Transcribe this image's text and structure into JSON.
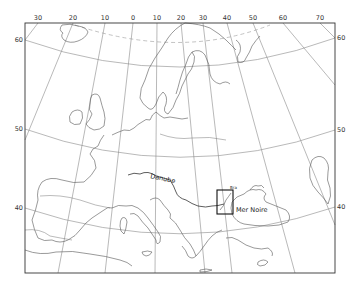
{
  "map": {
    "title": "",
    "frame": {
      "x": 25,
      "y": 23,
      "width": 310,
      "height": 250
    },
    "longitude_labels": [
      {
        "label": "30",
        "x": 38
      },
      {
        "label": "20",
        "x": 73
      },
      {
        "label": "10",
        "x": 105
      },
      {
        "label": "0",
        "x": 133
      },
      {
        "label": "10",
        "x": 157
      },
      {
        "label": "20",
        "x": 181
      },
      {
        "label": "30",
        "x": 203
      },
      {
        "label": "40",
        "x": 227
      },
      {
        "label": "50",
        "x": 253
      },
      {
        "label": "60",
        "x": 283
      },
      {
        "label": "70",
        "x": 320
      }
    ],
    "latitude_labels_left": [
      {
        "label": "60",
        "y": 40
      },
      {
        "label": "50",
        "y": 129
      },
      {
        "label": "40",
        "y": 208
      }
    ],
    "latitude_labels_right": [
      {
        "label": "60",
        "y": 38
      },
      {
        "label": "50",
        "y": 130
      },
      {
        "label": "40",
        "y": 207
      }
    ],
    "features": {
      "river_label": "Danube",
      "sea_label": "Mer Noire",
      "inset_box_label": "Bra"
    },
    "colors": {
      "background": "#ffffff",
      "frame": "#333333",
      "graticule": "#8a8a8a",
      "coastline": "#555555"
    }
  }
}
